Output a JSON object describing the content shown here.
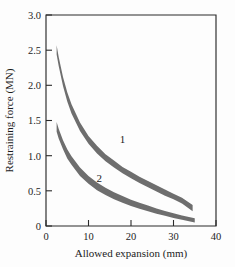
{
  "chart_data": {
    "type": "line",
    "title": "",
    "xlabel": "Allowed expansion (mm)",
    "ylabel": "Restraining force (MN)",
    "xlim": [
      0,
      40
    ],
    "ylim": [
      0,
      3.0
    ],
    "xticks": [
      0,
      10,
      20,
      30,
      40
    ],
    "xtick_labels": [
      "0",
      "10",
      "20",
      "30",
      "40"
    ],
    "yticks": [
      0,
      0.5,
      1.0,
      1.5,
      2.0,
      2.5,
      3.0
    ],
    "ytick_labels": [
      "0",
      "0.5",
      "1.0",
      "1.5",
      "2.0",
      "2.5",
      "3.0"
    ],
    "grid": false,
    "legend": "inline-curve-labels",
    "band_color": "#6e6e6e",
    "series": [
      {
        "name": "1",
        "label": "1",
        "label_x": 18.0,
        "label_y": 1.18,
        "x": [
          2.5,
          3.0,
          4.0,
          5.0,
          6.0,
          8.0,
          10.0,
          12.0,
          14.0,
          16.0,
          18.0,
          20.0,
          22.0,
          24.0,
          26.0,
          28.0,
          30.0,
          32.0,
          34.5
        ],
        "y_upper": [
          2.57,
          2.4,
          2.12,
          1.9,
          1.73,
          1.47,
          1.28,
          1.14,
          1.02,
          0.93,
          0.84,
          0.77,
          0.7,
          0.64,
          0.58,
          0.52,
          0.46,
          0.4,
          0.3
        ],
        "y_lower": [
          2.44,
          2.27,
          1.99,
          1.77,
          1.6,
          1.35,
          1.17,
          1.03,
          0.92,
          0.83,
          0.75,
          0.68,
          0.61,
          0.55,
          0.49,
          0.43,
          0.38,
          0.32,
          0.21
        ]
      },
      {
        "name": "2",
        "label": "2",
        "label_x": 12.5,
        "label_y": 0.62,
        "x": [
          2.5,
          3.0,
          4.0,
          5.0,
          6.0,
          8.0,
          10.0,
          12.0,
          14.0,
          16.0,
          18.0,
          20.0,
          22.0,
          24.0,
          26.0,
          28.0,
          30.0,
          32.0,
          35.0
        ],
        "y_upper": [
          1.48,
          1.38,
          1.22,
          1.09,
          0.99,
          0.83,
          0.71,
          0.62,
          0.545,
          0.48,
          0.425,
          0.375,
          0.33,
          0.29,
          0.25,
          0.215,
          0.18,
          0.15,
          0.11
        ],
        "y_lower": [
          1.34,
          1.24,
          1.09,
          0.96,
          0.87,
          0.71,
          0.6,
          0.51,
          0.44,
          0.38,
          0.33,
          0.285,
          0.245,
          0.21,
          0.175,
          0.145,
          0.115,
          0.09,
          0.05
        ]
      }
    ]
  },
  "axes": {
    "x_title": "Allowed expansion (mm)",
    "y_title": "Restraining force (MN)"
  }
}
